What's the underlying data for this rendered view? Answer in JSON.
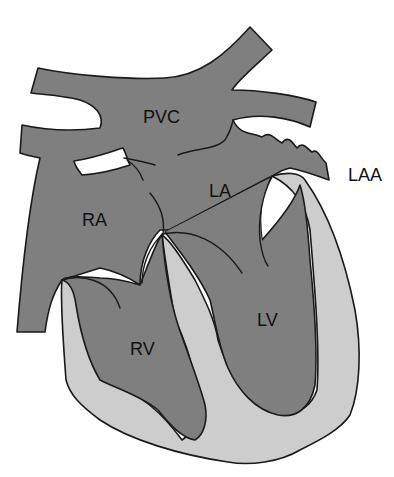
{
  "figure": {
    "colors": {
      "background": "#ffffff",
      "chamber_fill": "#7f7f7f",
      "myocardium_fill": "#cdcdcd",
      "outline": "#1a1a1a",
      "text": "#111111"
    },
    "labels": {
      "pvc": "PVC",
      "la": "LA",
      "laa": "LAA",
      "ra": "RA",
      "rv": "RV",
      "lv": "LV"
    }
  }
}
